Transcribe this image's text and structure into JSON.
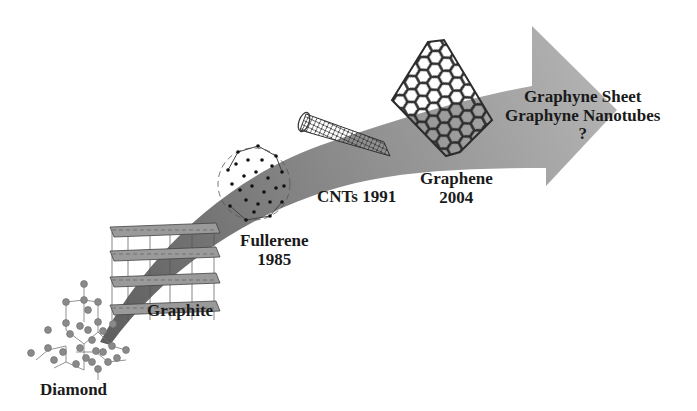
{
  "diagram": {
    "type": "timeline-arrow",
    "colors": {
      "arrow_dark": "#6a6a6a",
      "arrow_light": "#b0b0b0",
      "structure_stroke": "#3a3a3a",
      "atom_fill": "#8a8a8a",
      "text": "#1a1a1a"
    },
    "stages": [
      {
        "id": "diamond",
        "name": "Diamond",
        "year": ""
      },
      {
        "id": "graphite",
        "name": "Graphite",
        "year": ""
      },
      {
        "id": "fullerene",
        "name": "Fullerene",
        "year": "1985"
      },
      {
        "id": "cnts",
        "name": "CNTs 1991",
        "year": "1991"
      },
      {
        "id": "graphene",
        "name": "Graphene",
        "year": "2004"
      },
      {
        "id": "graphyne",
        "name": "Graphyne Sheet",
        "name2": "Graphyne Nanotubes",
        "year": "?"
      }
    ]
  }
}
